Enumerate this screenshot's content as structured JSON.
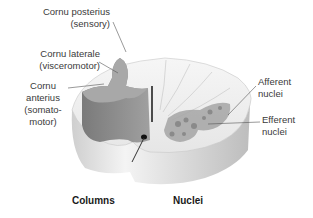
{
  "labels": {
    "cornu_posterius": {
      "line1": "Cornu posterius",
      "line2": "(sensory)"
    },
    "cornu_laterale": {
      "line1": "Cornu laterale",
      "line2": "(visceromotor)"
    },
    "cornu_anterius": {
      "line1": "Cornu",
      "line2": "anterius",
      "line3": "(somato-",
      "line4": "motor)"
    },
    "afferent": {
      "line1": "Afferent",
      "line2": "nuclei"
    },
    "efferent": {
      "line1": "Efferent",
      "line2": "nuclei"
    }
  },
  "captions": {
    "left": "Columns",
    "right": "Nuclei"
  },
  "colors": {
    "white_matter": "#f2f2f2",
    "grey_column": "#8c8c8c",
    "nuclei": "#9a9a9a",
    "text": "#3a3a3a"
  }
}
